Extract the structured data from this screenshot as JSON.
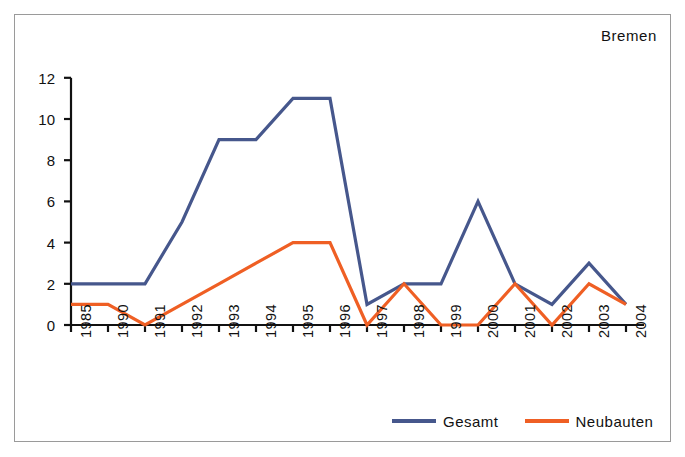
{
  "chart_data": {
    "type": "line",
    "title": "Bremen",
    "xlabel": "",
    "ylabel": "",
    "categories": [
      "1985",
      "1990",
      "1991",
      "1992",
      "1993",
      "1994",
      "1995",
      "1996",
      "1997",
      "1998",
      "1999",
      "2000",
      "2001",
      "2002",
      "2003",
      "2004"
    ],
    "series": [
      {
        "name": "Gesamt",
        "color": "#46578c",
        "values": [
          2,
          2,
          2,
          5,
          9,
          9,
          11,
          11,
          1,
          2,
          2,
          6,
          2,
          1,
          3,
          1
        ]
      },
      {
        "name": "Neubauten",
        "color": "#ef5f24",
        "values": [
          1,
          1,
          0,
          1,
          2,
          3,
          4,
          4,
          0,
          2,
          0,
          0,
          2,
          0,
          2,
          1
        ]
      }
    ],
    "ylim": [
      0,
      12
    ],
    "yticks": [
      0,
      2,
      4,
      6,
      8,
      10,
      12
    ],
    "ytick_labels": [
      "0",
      "2",
      "4",
      "6",
      "8",
      "10",
      "12"
    ],
    "grid": false,
    "legend_position": "bottom-right",
    "xtick_rotation": -90
  },
  "figure": {
    "border_color": "#9a9a9a",
    "background": "#ffffff",
    "axis_color": "#111111"
  },
  "legend": {
    "entries": [
      {
        "label": "Gesamt",
        "color": "#46578c"
      },
      {
        "label": "Neubauten",
        "color": "#ef5f24"
      }
    ]
  }
}
